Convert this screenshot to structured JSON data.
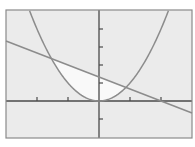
{
  "chart_data": {
    "type": "line",
    "title": "",
    "xlabel": "",
    "ylabel": "",
    "xlim": [
      -3,
      3
    ],
    "ylim": [
      -2,
      5
    ],
    "x_ticks": [
      -2,
      -1,
      1,
      2
    ],
    "y_ticks": [
      -1,
      1,
      2,
      3,
      4
    ],
    "tick_labels_shown": false,
    "grid": false,
    "legend": null,
    "series": [
      {
        "name": "parabola",
        "equation": "y = x^2",
        "x": [
          -2.23,
          -2,
          -1.5,
          -1,
          -0.5,
          0,
          0.5,
          1,
          1.5,
          2,
          2.23
        ],
        "y": [
          4.97,
          4,
          2.25,
          1,
          0.25,
          0,
          0.25,
          1,
          2.25,
          4,
          4.97
        ]
      },
      {
        "name": "line",
        "equation": "y = -2/3 x + 4/3",
        "x": [
          -3,
          0,
          2,
          3
        ],
        "y": [
          3.33,
          1.33,
          0,
          -0.67
        ]
      }
    ],
    "shaded_region": {
      "description": "Region bounded between line (above) and parabola (below)",
      "x_from": -1.535,
      "x_to": 0.868
    },
    "intersections": [
      {
        "x": -1.535,
        "y": 2.36
      },
      {
        "x": 0.868,
        "y": 0.755
      }
    ]
  },
  "colors": {
    "background": "#ebebeb",
    "shaded": "#f9f9f9",
    "curve": "#8c8c8c",
    "axis": "#4a4a4a",
    "frame": "#8a8a8a"
  }
}
